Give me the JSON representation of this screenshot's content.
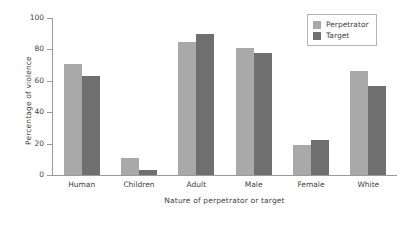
{
  "chart_data": {
    "type": "bar",
    "title": "",
    "xlabel": "Nature of perpetrator or target",
    "ylabel": "Percentage of violence",
    "categories": [
      "Human",
      "Children",
      "Adult",
      "Male",
      "Female",
      "White"
    ],
    "series": [
      {
        "name": "Perpetrator",
        "color": "#a9a9a9",
        "values": [
          71,
          11,
          85,
          81,
          19,
          66
        ]
      },
      {
        "name": "Target",
        "color": "#6f6f6f",
        "values": [
          63,
          3,
          90,
          78,
          22,
          57
        ]
      }
    ],
    "ylim": [
      0,
      100
    ],
    "yticks": [
      0,
      20,
      40,
      60,
      80,
      100
    ],
    "ytick_labels": [
      "0",
      "20",
      "40",
      "60",
      "80",
      "100"
    ],
    "grid": false,
    "legend_position": "top-right"
  },
  "legend": {
    "items": [
      {
        "label": "Perpetrator"
      },
      {
        "label": "Target"
      }
    ]
  },
  "colors": {
    "perpetrator": "#a9a9a9",
    "target": "#6f6f6f",
    "axis": "#9a9a9a",
    "text": "#3f3f3f",
    "background": "#ffffff"
  }
}
